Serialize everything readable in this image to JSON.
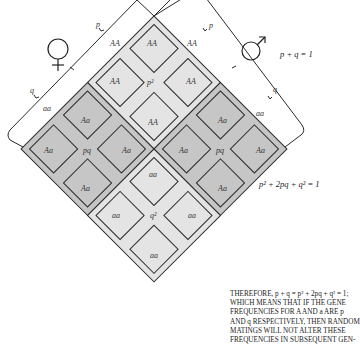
{
  "diagram": {
    "female_symbol": "♀",
    "male_symbol": "♂",
    "female_axis": {
      "p_label": "p",
      "q_label": "q"
    },
    "male_axis": {
      "p_label": "p",
      "q_label": "q"
    },
    "equation_top": "p + q = 1",
    "equation_side": "p² + 2pq + q² = 1",
    "blocks": [
      {
        "id": "p2",
        "center_label": "p²",
        "cells": [
          "AA",
          "AA",
          "AA",
          "AA"
        ],
        "outer_labels": [
          "AA",
          "AA"
        ]
      },
      {
        "id": "pq_left",
        "center_label": "pq",
        "cells": [
          "Aa",
          "Aa",
          "Aa",
          "Aa"
        ]
      },
      {
        "id": "pq_right",
        "center_label": "pq",
        "cells": [
          "Aa",
          "Aa",
          "Aa",
          "Aa"
        ]
      },
      {
        "id": "q2",
        "center_label": "q²",
        "cells": [
          "aa",
          "aa",
          "aa",
          "aa"
        ],
        "outer_labels": [
          "aa",
          "aa"
        ]
      }
    ],
    "colors": {
      "homozygous_fill": "#e4e4e4",
      "heterozygous_fill": "#c6c6c6",
      "line": "#2a2a2a",
      "background": "#ffffff"
    }
  },
  "caption": {
    "lines": [
      "THEREFORE, p + q = p² + 2pq + q² = 1;",
      "WHICH MEANS THAT IF THE GENE",
      "FREQUENCIES FOR A AND a ARE p",
      "AND q RESPECTIVELY, THEN RANDOM",
      "MATINGS WILL NOT ALTER THESE",
      "FREQUENCIES IN SUBSEQUENT GEN-"
    ]
  }
}
